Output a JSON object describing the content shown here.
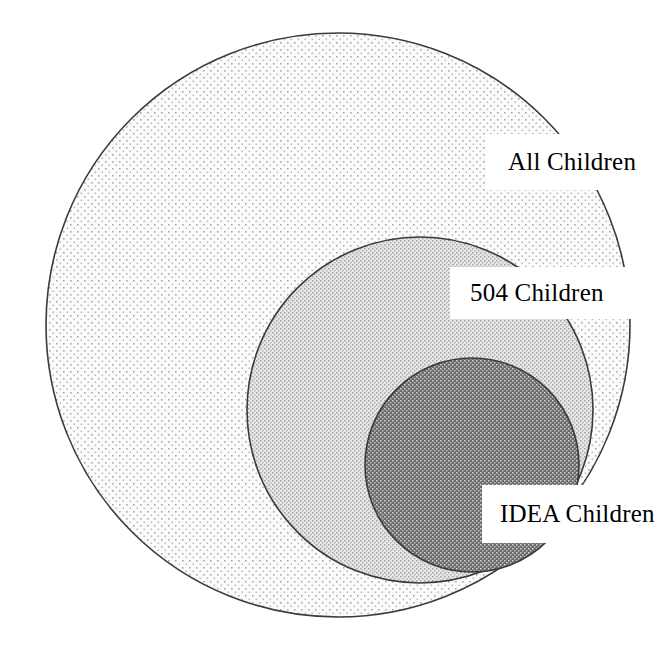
{
  "diagram": {
    "type": "nested-sets-venn",
    "title": "",
    "background_color": "#ffffff",
    "outline_color": "#3a3a3a",
    "sets": [
      {
        "id": "all-children",
        "label": "All Children",
        "fill_color": "#f4f4f4",
        "dot_color": "#9a9a9a",
        "center_x": 338,
        "center_y": 325,
        "radius": 292,
        "density": "sparse"
      },
      {
        "id": "504-children",
        "label": "504 Children",
        "fill_color": "#dcdcdc",
        "dot_color": "#8a8a8a",
        "center_x": 420,
        "center_y": 410,
        "radius": 173,
        "density": "medium"
      },
      {
        "id": "idea-children",
        "label": "IDEA Children",
        "fill_color": "#6f6f6f",
        "dot_color": "#dcdcdc",
        "center_x": 472,
        "center_y": 465,
        "radius": 107,
        "density": "dense"
      }
    ],
    "label_text_color": "#000000",
    "label_background_color": "#ffffff"
  }
}
